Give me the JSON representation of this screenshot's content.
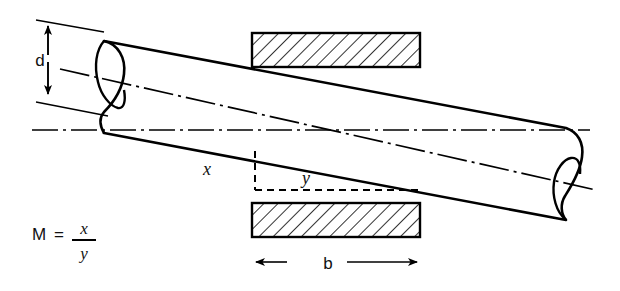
{
  "figure": {
    "type": "engineering-diagram",
    "background_color": "#ffffff",
    "line_color": "#000000",
    "hatch_color": "#000000"
  },
  "labels": {
    "diameter": "d",
    "offset_vertical": "x",
    "offset_horizontal": "y",
    "block_width": "b"
  },
  "formula": {
    "lhs": "M",
    "equals": "=",
    "numerator": "x",
    "denominator": "y",
    "full": "M = x/y"
  },
  "annotations": {
    "dimension_d": "d",
    "dimension_b": "b",
    "rise": "x",
    "run": "y"
  },
  "geometry": {
    "cylinder": {
      "left_end_center": [
        103,
        88
      ],
      "right_end_center": [
        570,
        175
      ],
      "radius": 46,
      "tilt_note": "axis inclined downward to the right"
    },
    "top_block": {
      "x": 252,
      "y": 33,
      "width": 168,
      "height": 34
    },
    "bottom_block": {
      "x": 252,
      "y": 203,
      "width": 168,
      "height": 34
    },
    "horizontal_datum_y": 130,
    "dashed_corner": [
      255,
      152
    ]
  }
}
